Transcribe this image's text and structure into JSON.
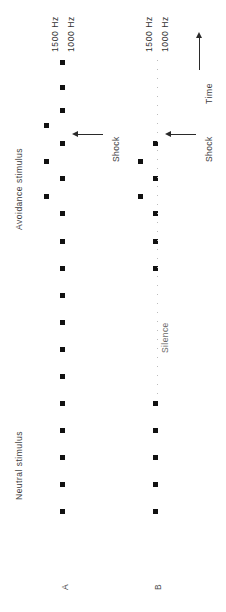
{
  "figure": {
    "background_color": "#ffffff",
    "marker_color": "#111111",
    "dotted_color": "#bdbdbd",
    "width": 226,
    "height": 612,
    "orientation": "rotated-90-ccw"
  },
  "axis": {
    "time_label": "Time",
    "time_arrow": "arrow-up"
  },
  "category_labels": {
    "avoidance": "Avoidance  stimulus",
    "neutral": "Neutral  stimulus"
  },
  "panels": [
    {
      "id": "A",
      "label": "A",
      "tracks": [
        {
          "name": "1500 Hz",
          "tone_hz": 1500
        },
        {
          "name": "1000 Hz",
          "tone_hz": 1000
        }
      ],
      "shock_label": "Shock",
      "marker_count": 19
    },
    {
      "id": "B",
      "label": "B",
      "tracks": [
        {
          "name": "1500 Hz",
          "tone_hz": 1500
        },
        {
          "name": "1000 Hz",
          "tone_hz": 1000
        }
      ],
      "shock_label": "Shock",
      "silence_label": "Silence",
      "marker_count": 14
    }
  ],
  "chart_data": {
    "type": "scatter",
    "title": "",
    "xlabel": "",
    "ylabel": "Time",
    "grid": false,
    "legend": "none",
    "series": [
      {
        "name": "A / 1500 Hz",
        "panel": "A",
        "track": "1500 Hz",
        "marker": "square",
        "color": "#111111",
        "x_px": 46,
        "y_px": [
          125,
          161,
          196
        ]
      },
      {
        "name": "A / 1000 Hz",
        "panel": "A",
        "track": "1000 Hz",
        "marker": "square",
        "color": "#111111",
        "x_px": 62,
        "y_px": [
          62,
          87,
          110,
          143,
          178,
          213,
          241,
          268,
          295,
          322,
          349,
          376,
          403,
          430,
          457,
          484,
          511
        ]
      },
      {
        "name": "B / 1500 Hz",
        "panel": "B",
        "track": "1500 Hz",
        "marker": "square",
        "color": "#111111",
        "x_px": 140,
        "y_px": [
          161,
          196
        ]
      },
      {
        "name": "B / 1000 Hz",
        "panel": "B",
        "track": "1000 Hz",
        "marker": "square",
        "color": "#111111",
        "x_px": 155,
        "y_px": [
          143,
          178,
          213,
          241,
          268,
          403,
          430,
          457,
          484,
          511
        ]
      },
      {
        "name": "B / Silence (dotted)",
        "panel": "B",
        "track": "1000 Hz",
        "marker": "dotted-line",
        "color": "#bdbdbd",
        "x_px": 157,
        "y_range_px": [
          60,
          395
        ]
      }
    ],
    "annotations": [
      {
        "text": "Shock",
        "panel": "A",
        "x_px": 100,
        "y_px": 133,
        "arrow": "left"
      },
      {
        "text": "Shock",
        "panel": "B",
        "x_px": 192,
        "y_px": 133,
        "arrow": "left"
      },
      {
        "text": "Silence",
        "panel": "B",
        "x_px": 160,
        "y_px": 330
      },
      {
        "text": "Time",
        "x_px": 200,
        "y_px": 110,
        "arrow": "up"
      }
    ]
  }
}
